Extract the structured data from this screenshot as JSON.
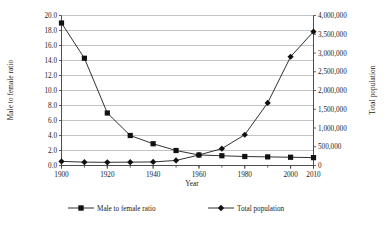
{
  "chart_data": {
    "type": "line",
    "title": "",
    "xlabel": "Year",
    "x": [
      1900,
      1910,
      1920,
      1930,
      1940,
      1950,
      1960,
      1970,
      1980,
      1990,
      2000,
      2010
    ],
    "xtick_labels": [
      "1900",
      "1920",
      "1940",
      "1960",
      "1980",
      "2000",
      "2010"
    ],
    "xtick_values": [
      1900,
      1920,
      1940,
      1960,
      1980,
      2000,
      2010
    ],
    "xlim": [
      1900,
      2010
    ],
    "grid": true,
    "legend_position": "bottom",
    "axes": [
      {
        "id": "left",
        "ylabel": "Male to female ratio",
        "ylim": [
          0.0,
          20.0
        ],
        "ytick_labels": [
          "0.0",
          "2.0",
          "4.0",
          "6.0",
          "8.0",
          "10.0",
          "12.0",
          "14.0",
          "16.0",
          "18.0",
          "20.0"
        ],
        "ytick_values": [
          0,
          2,
          4,
          6,
          8,
          10,
          12,
          14,
          16,
          18,
          20
        ]
      },
      {
        "id": "right",
        "ylabel": "Total population",
        "ylim": [
          0,
          4000000
        ],
        "ytick_labels": [
          "0",
          "500,000",
          "1,000,000",
          "1,500,000",
          "2,000,000",
          "2,500,000",
          "3,000,000",
          "3,500,000",
          "4,000,000"
        ],
        "ytick_values": [
          0,
          500000,
          1000000,
          1500000,
          2000000,
          2500000,
          3000000,
          3500000,
          4000000
        ]
      }
    ],
    "series": [
      {
        "name": "Male to female ratio",
        "axis": "left",
        "marker": "square",
        "color": "#111111",
        "values": [
          19.0,
          14.3,
          7.0,
          4.0,
          2.9,
          2.0,
          1.4,
          1.3,
          1.2,
          1.15,
          1.1,
          1.05
        ]
      },
      {
        "name": "Total population",
        "axis": "right",
        "marker": "diamond",
        "color": "#111111",
        "values": [
          110000,
          90000,
          85000,
          90000,
          95000,
          135000,
          280000,
          450000,
          820000,
          1670000,
          2900000,
          3570000
        ]
      }
    ],
    "legend": [
      {
        "label": "Male to female ratio",
        "marker": "square"
      },
      {
        "label": "Total population",
        "marker": "diamond"
      }
    ]
  }
}
